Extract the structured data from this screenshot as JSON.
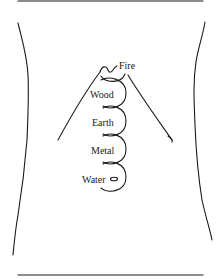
{
  "diagram": {
    "labels": {
      "fire": "Fire",
      "wood": "Wood",
      "earth": "Earth",
      "metal": "Metal",
      "water": "Water"
    },
    "colors": {
      "line": "#1a1a1a",
      "background": "#ffffff"
    }
  }
}
